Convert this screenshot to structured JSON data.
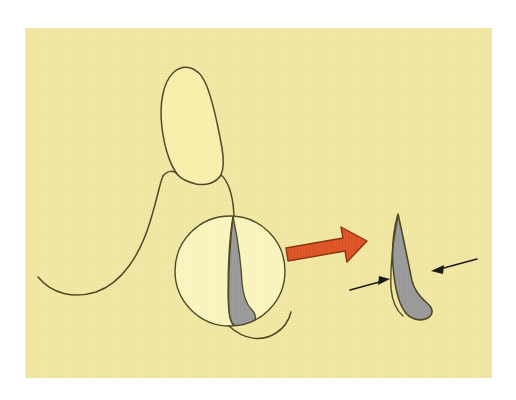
{
  "figure": {
    "kind": "dental-anatomy-illustration",
    "title": "Tooth cross-section with magnified enamel sliver",
    "caption_text": "",
    "canvas": {
      "width": 516,
      "height": 400
    }
  },
  "colors": {
    "page_background": "#ffffff",
    "card_background": "#f0e7a4",
    "card_background_texture": "#ecdf97",
    "crown_fill": "#f7f0ae",
    "magnifier_fill": "#faf4c0",
    "sliver_gray": "#9c9c9c",
    "sliver_gray_dark": "#8d8d8d",
    "outline_ink": "#4f4a26",
    "arrow_orange": "#e0582a",
    "arrow_orange_shade": "#c9441b",
    "arrow_orange_outline": "#8a3410",
    "pointer_black": "#1a1a1a"
  },
  "card": {
    "x": 25,
    "y": 28,
    "width": 467,
    "height": 350,
    "border_color": "#ffffff"
  },
  "elements": {
    "crown": {
      "label": "tooth crown outline",
      "fill": "#f7f0ae",
      "stroke": "#4f4a26"
    },
    "gum_curve": {
      "label": "gingival / alveolar curve",
      "stroke": "#4f4a26"
    },
    "root_stem": {
      "label": "root stem line",
      "stroke": "#4f4a26"
    },
    "magnifier_circle": {
      "label": "magnifier circle",
      "cx": 230,
      "cy": 271,
      "r": 55,
      "fill": "#faf4c0",
      "stroke": "#4f4a26"
    },
    "sliver_small": {
      "label": "gray enamel sliver inside magnifier",
      "fill": "#9c9c9c",
      "stroke": "#4f4a26"
    },
    "orange_arrow": {
      "label": "magnification direction arrow",
      "direction": "right",
      "fill": "#e0582a",
      "stroke": "#8a3410"
    },
    "sliver_large": {
      "label": "enlarged gray enamel sliver",
      "fill": "#9c9c9c",
      "stroke": "#4f4a26"
    },
    "pointer_arrow_left": {
      "label": "left pointer arrow to sliver neck",
      "stroke": "#1a1a1a",
      "points_to": "right"
    },
    "pointer_arrow_right": {
      "label": "right pointer arrow to sliver bulge",
      "stroke": "#1a1a1a",
      "points_to": "left"
    }
  },
  "labels": {
    "none_visible": ""
  }
}
